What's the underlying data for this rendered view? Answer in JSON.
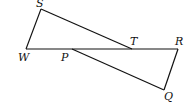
{
  "figure": {
    "points": {
      "S": {
        "label": "S",
        "x": 41,
        "y": 9
      },
      "W": {
        "label": "W",
        "x": 26,
        "y": 49
      },
      "P": {
        "label": "P",
        "x": 72,
        "y": 49
      },
      "T": {
        "label": "T",
        "x": 132,
        "y": 49
      },
      "R": {
        "label": "R",
        "x": 178,
        "y": 49
      },
      "Q": {
        "label": "Q",
        "x": 164,
        "y": 90
      }
    },
    "segments": [
      "SW",
      "WR",
      "ST",
      "PQ",
      "RQ"
    ],
    "colors": {
      "stroke": "#111111",
      "background": "#ffffff"
    }
  }
}
